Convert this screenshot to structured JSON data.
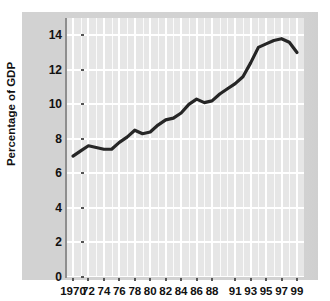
{
  "chart_data": {
    "type": "line",
    "title": "",
    "xlabel": "",
    "ylabel": "Percentage of GDP",
    "xlim": [
      1970,
      1999
    ],
    "ylim": [
      0,
      15
    ],
    "grid": true,
    "legend": false,
    "legend_position": "none",
    "line_color": "#262626",
    "plot_bg": "#e6e6e6",
    "panel_bg": "#d2d2d2",
    "x": [
      1970,
      1971,
      1972,
      1973,
      1974,
      1975,
      1976,
      1977,
      1978,
      1979,
      1980,
      1981,
      1982,
      1983,
      1984,
      1985,
      1986,
      1987,
      1988,
      1989,
      1990,
      1991,
      1992,
      1993,
      1994,
      1995,
      1996,
      1997,
      1998,
      1999
    ],
    "values": [
      7.0,
      7.3,
      7.6,
      7.5,
      7.4,
      7.4,
      7.8,
      8.1,
      8.5,
      8.3,
      8.4,
      8.8,
      9.1,
      9.2,
      9.5,
      10.0,
      10.3,
      10.1,
      10.2,
      10.6,
      10.9,
      11.2,
      11.6,
      12.4,
      13.3,
      13.5,
      13.7,
      13.8,
      13.6,
      13.0
    ],
    "y_ticks": [
      0,
      2,
      4,
      6,
      8,
      10,
      12,
      14
    ],
    "y_tick_labels": [
      "0",
      "2",
      "4",
      "6",
      "8",
      "10",
      "12",
      "14"
    ],
    "x_ticks": [
      1970,
      1972,
      1974,
      1976,
      1978,
      1980,
      1982,
      1984,
      1986,
      1988,
      1991,
      1993,
      1995,
      1997,
      1999
    ],
    "x_tick_labels": [
      "1970",
      "72",
      "74",
      "76",
      "78",
      "80",
      "82",
      "84",
      "86",
      "88",
      "91",
      "93",
      "95",
      "97",
      "99"
    ]
  }
}
